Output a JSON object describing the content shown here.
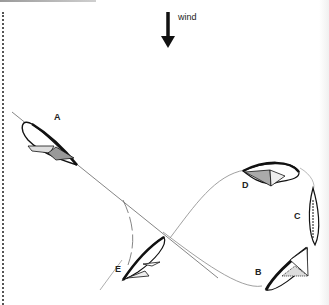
{
  "wind": {
    "label": "wind",
    "direction": "down",
    "icon": "arrow-down-icon"
  },
  "boats": [
    {
      "id": "A",
      "label": "A"
    },
    {
      "id": "B",
      "label": "B"
    },
    {
      "id": "C",
      "label": "C"
    },
    {
      "id": "D",
      "label": "D"
    },
    {
      "id": "E",
      "label": "E"
    }
  ],
  "colors": {
    "ink": "#111111",
    "track": "#888888",
    "sail_fill": "#bbbbbb"
  }
}
